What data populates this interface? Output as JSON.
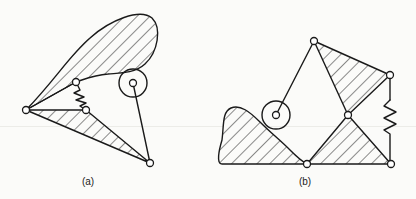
{
  "figure": {
    "panels": [
      {
        "id": "a",
        "label": "(a)"
      },
      {
        "id": "b",
        "label": "(b)"
      }
    ]
  },
  "colors": {
    "ink": "#1a1a1a",
    "background": "#fbfbf9"
  }
}
